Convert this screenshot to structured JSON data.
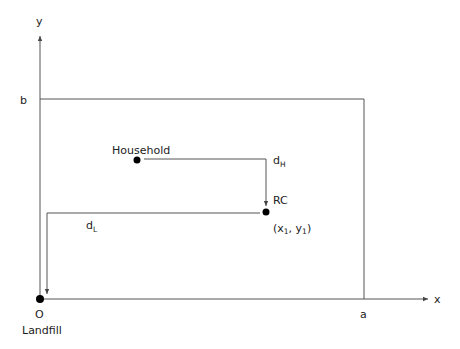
{
  "diagram": {
    "axes": {
      "x_label": "x",
      "y_label": "y",
      "x_extent_label": "a",
      "y_extent_label": "b"
    },
    "origin": {
      "symbol": "O",
      "name": "Landfill"
    },
    "household": {
      "label": "Household"
    },
    "recycling_center": {
      "label": "RC",
      "coord_open": "(x",
      "coord_sub1": "1",
      "coord_mid": ", y",
      "coord_sub2": "1",
      "coord_close": ")"
    },
    "distances": {
      "household_to_rc": {
        "main": "d",
        "sub": "H"
      },
      "rc_to_landfill": {
        "main": "d",
        "sub": "L"
      }
    },
    "colors": {
      "line": "#555555",
      "dot": "#000000",
      "text": "#222222"
    }
  }
}
